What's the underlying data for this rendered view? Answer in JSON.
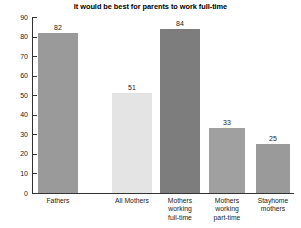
{
  "chart_data": {
    "type": "bar",
    "title": "It would be best for parents to work full-time",
    "xlabel": "",
    "ylabel": "",
    "ylim": [
      0,
      90
    ],
    "ytick_step": 10,
    "grid": false,
    "legend": "none",
    "categories": [
      "Fathers",
      "All Mothers",
      "Mothers\nworking\nfull-time",
      "Mothers\nworking\npart-time",
      "Stayhome\nmothers"
    ],
    "values": [
      82,
      51,
      84,
      33,
      25
    ],
    "bar_colors": [
      "#9a9a9a",
      "#e4e4e4",
      "#7d7d7d",
      "#a0a0a0",
      "#9a9a9a"
    ],
    "ytick_labels": [
      "0",
      "10",
      "20",
      "30",
      "40",
      "50",
      "60",
      "70",
      "80",
      "90"
    ],
    "value_labels": [
      "82",
      "51",
      "84",
      "33",
      "25"
    ]
  },
  "colors": {
    "axis": "#333333",
    "text": "#222222",
    "background": "#ffffff"
  }
}
